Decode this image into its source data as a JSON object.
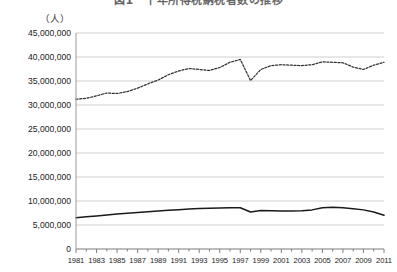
{
  "figure": {
    "title": "図1　十年所得税納税者数の推移",
    "unit_label": "（人）"
  },
  "chart_data": {
    "type": "line",
    "title": "図1　十年所得税納税者数の推移",
    "xlabel": "",
    "ylabel": "（人）",
    "ylim": [
      0,
      45000000
    ],
    "xlim": [
      1981,
      2011
    ],
    "grid": true,
    "legend_position": "none",
    "ytick_labels": [
      "45,000,000",
      "40,000,000",
      "35,000,000",
      "30,000,000",
      "25,000,000",
      "20,000,000",
      "15,000,000",
      "10,000,000",
      "5,000,000",
      "0"
    ],
    "ytick_values": [
      45000000,
      40000000,
      35000000,
      30000000,
      25000000,
      20000000,
      15000000,
      10000000,
      5000000,
      0
    ],
    "xtick_labels": [
      "1981",
      "1983",
      "1985",
      "1987",
      "1989",
      "1991",
      "1993",
      "1995",
      "1997",
      "1999",
      "2001",
      "2003",
      "2005",
      "2007",
      "2009",
      "2011"
    ],
    "xtick_values": [
      1981,
      1983,
      1985,
      1987,
      1989,
      1991,
      1993,
      1995,
      1997,
      1999,
      2001,
      2003,
      2005,
      2007,
      2009,
      2011
    ],
    "x": [
      1981,
      1982,
      1983,
      1984,
      1985,
      1986,
      1987,
      1988,
      1989,
      1990,
      1991,
      1992,
      1993,
      1994,
      1995,
      1996,
      1997,
      1998,
      1999,
      2000,
      2001,
      2002,
      2003,
      2004,
      2005,
      2006,
      2007,
      2008,
      2009,
      2010,
      2011
    ],
    "series": [
      {
        "name": "上段系列（破線）",
        "style": "dashed",
        "color": "#333333",
        "values": [
          31200000,
          31400000,
          31900000,
          32500000,
          32400000,
          32800000,
          33500000,
          34400000,
          35200000,
          36300000,
          37100000,
          37600000,
          37400000,
          37200000,
          37800000,
          38900000,
          39500000,
          35100000,
          37400000,
          38200000,
          38400000,
          38300000,
          38200000,
          38400000,
          39000000,
          38900000,
          38800000,
          37900000,
          37400000,
          38300000,
          38900000
        ]
      },
      {
        "name": "下段系列（実線）",
        "style": "solid",
        "color": "#1a1a1a",
        "values": [
          6500000,
          6700000,
          6900000,
          7100000,
          7300000,
          7450000,
          7600000,
          7750000,
          7900000,
          8050000,
          8200000,
          8350000,
          8450000,
          8500000,
          8550000,
          8600000,
          8600000,
          7700000,
          8000000,
          7950000,
          7900000,
          7900000,
          7950000,
          8150000,
          8600000,
          8700000,
          8600000,
          8400000,
          8150000,
          7700000,
          7050000
        ]
      }
    ]
  }
}
